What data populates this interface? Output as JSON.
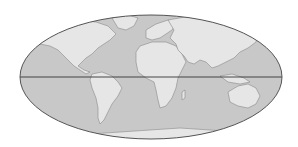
{
  "map": {
    "projection": "Mollweide world map",
    "colors": {
      "background": "#ffffff",
      "ocean": "#c8c8c8",
      "land": "#e6e6e6",
      "coastline": "#8a8a8a",
      "outline": "#555555",
      "equator": "#333333"
    },
    "features": {
      "equator_line": true,
      "continents": [
        "North America",
        "South America",
        "Europe",
        "Africa",
        "Asia",
        "Australia",
        "Antarctica",
        "Greenland"
      ]
    }
  }
}
